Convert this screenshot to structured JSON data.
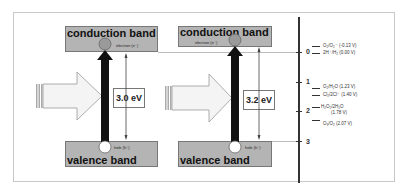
{
  "diagram": {
    "left_panel": {
      "conduction_band_label": "conduction band",
      "valence_band_label": "valence band",
      "electron_label": "electron (e⁻)",
      "hole_label": "hole (h⁺)",
      "uv_label": "UV",
      "wavelength_label": "λ < 413",
      "band_gap_label": "3.0 eV"
    },
    "right_panel": {
      "conduction_band_label": "conduction band",
      "valence_band_label": "valence band",
      "electron_label": "electron (e⁻)",
      "hole_label": "hole (h⁺)",
      "uv_label": "UV",
      "wavelength_label": "λ < 388",
      "band_gap_label": "3.2 eV"
    },
    "potential_axis": {
      "ticks": [
        "0",
        "1",
        "2",
        "3"
      ],
      "potentials": [
        "O₂/O₂⁻ (-0.13 V)",
        "2H⁺/H₂ (0.00 V)",
        "O₂/H₂O (1.23 V)",
        "Cl₂/2Cl⁻ (1.40 V)",
        "H₂O₂/2H₂O",
        "(1.78 V)",
        "O₃/O₂ (2.07 V)"
      ]
    },
    "colors": {
      "band_fill": "#b4b4b4",
      "arrow_fill": "#111111",
      "axis": "#333333"
    }
  }
}
